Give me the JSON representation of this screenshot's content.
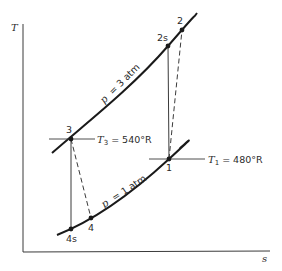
{
  "axes": {
    "y_label": "T",
    "x_label": "s"
  },
  "curves": {
    "high_pressure": {
      "label": "p = 3 atm",
      "p_symbol": "p",
      "value_text": "= 3 atm"
    },
    "low_pressure": {
      "label": "p = 1 atm",
      "p_symbol": "p",
      "value_text": "= 1 atm"
    }
  },
  "states": [
    {
      "id": "1",
      "label": "1"
    },
    {
      "id": "2",
      "label": "2"
    },
    {
      "id": "2s",
      "label": "2s"
    },
    {
      "id": "3",
      "label": "3"
    },
    {
      "id": "4",
      "label": "4"
    },
    {
      "id": "4s",
      "label": "4s"
    }
  ],
  "annotations": {
    "t3": {
      "symbol": "T",
      "subscript": "3",
      "value": "= 540°R"
    },
    "t1": {
      "symbol": "T",
      "subscript": "1",
      "value": "= 480°R"
    }
  },
  "processes": {
    "isentropic_compression": "1 → 2s",
    "actual_compression": "1 → 2",
    "isentropic_expansion": "3 → 4s",
    "actual_expansion": "3 → 4"
  },
  "colors": {
    "line": "#1a1a1a",
    "axis": "#3a3a3a",
    "text": "#2a2a2a"
  }
}
